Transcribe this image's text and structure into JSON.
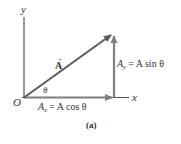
{
  "diagram": {
    "caption": "(a)",
    "axes": {
      "x_label": "x",
      "y_label": "y",
      "origin_label": "O",
      "color": "#555555"
    },
    "vector": {
      "label": "A",
      "arrow_glyph": "→",
      "color": "#5a5a5a"
    },
    "angle_label": "θ",
    "components": {
      "x": {
        "symbol": "A",
        "subscript": "x",
        "expression": "= A cos θ"
      },
      "y": {
        "symbol": "A",
        "subscript": "y",
        "expression": "= A sin θ"
      },
      "color": "#7a7a7a"
    }
  }
}
